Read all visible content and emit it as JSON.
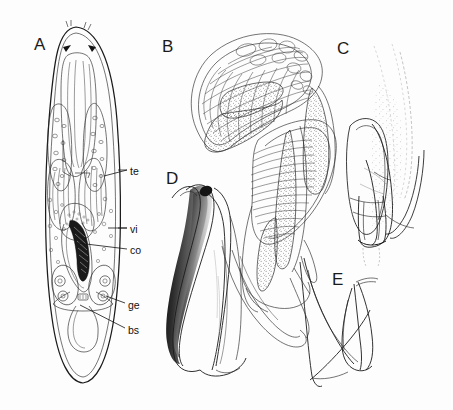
{
  "figure": {
    "kind": "scientific-illustration-plate",
    "style": "black ink line drawing on white",
    "background_color": "#fdfdfd",
    "ink_color": "#1b1b1b",
    "width": 453,
    "height": 410
  },
  "panels": [
    {
      "id": "A",
      "letter": "A",
      "caption": "whole body, dorsal view, organs in situ",
      "letter_x": 34,
      "letter_y": 36
    },
    {
      "id": "B",
      "letter": "B",
      "caption": "copulatory apparatus, detail",
      "letter_x": 162,
      "letter_y": 38
    },
    {
      "id": "C",
      "letter": "C",
      "caption": "sclerotized stylet, lateral",
      "letter_x": 337,
      "letter_y": 40
    },
    {
      "id": "D",
      "letter": "D",
      "caption": "sclerotized spine, dark pigmented",
      "letter_x": 166,
      "letter_y": 170
    },
    {
      "id": "E",
      "letter": "E",
      "caption": "accessory sclerite",
      "letter_x": 332,
      "letter_y": 271
    }
  ],
  "annotations": [
    {
      "id": "te",
      "label": "te",
      "meaning": "testis",
      "label_x": 130,
      "label_y": 166,
      "leader": [
        [
          104,
          176
        ],
        [
          127,
          170
        ]
      ]
    },
    {
      "id": "vi",
      "label": "vi",
      "meaning": "vitellaria",
      "label_x": 130,
      "label_y": 224,
      "leader": [
        [
          108,
          228
        ],
        [
          127,
          228
        ]
      ]
    },
    {
      "id": "co",
      "label": "co",
      "meaning": "copulatory organ",
      "label_x": 130,
      "label_y": 245,
      "leader": [
        [
          78,
          243
        ],
        [
          127,
          249
        ]
      ]
    },
    {
      "id": "ge",
      "label": "ge",
      "meaning": "germaria",
      "label_x": 128,
      "label_y": 300,
      "leader": [
        [
          106,
          296
        ],
        [
          125,
          303
        ]
      ]
    },
    {
      "id": "bs",
      "label": "bs",
      "meaning": "bursa",
      "label_x": 128,
      "label_y": 325,
      "leader": [
        [
          80,
          305
        ],
        [
          125,
          328
        ]
      ]
    }
  ]
}
